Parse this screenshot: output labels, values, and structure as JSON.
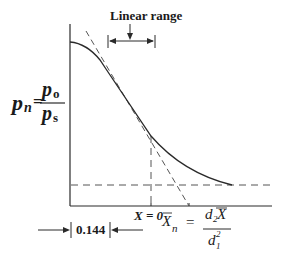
{
  "diagram": {
    "title_annotation": "Linear range",
    "y_axis_label": {
      "lhs": "p",
      "lhs_sub": "n",
      "num": "p",
      "num_sub": "o",
      "den": "p",
      "den_sub": "s"
    },
    "x_zero_label": "X = 0",
    "offset_value": "0.144",
    "xn_formula": {
      "lhs": "X",
      "lhs_sub": "n",
      "num": "d",
      "num_sub": "2",
      "num_var": "X",
      "den": "d",
      "den_sub": "1",
      "den_sup": "2"
    },
    "colors": {
      "line": "#2a2a2a",
      "dash": "#555555",
      "background": "#ffffff"
    }
  }
}
